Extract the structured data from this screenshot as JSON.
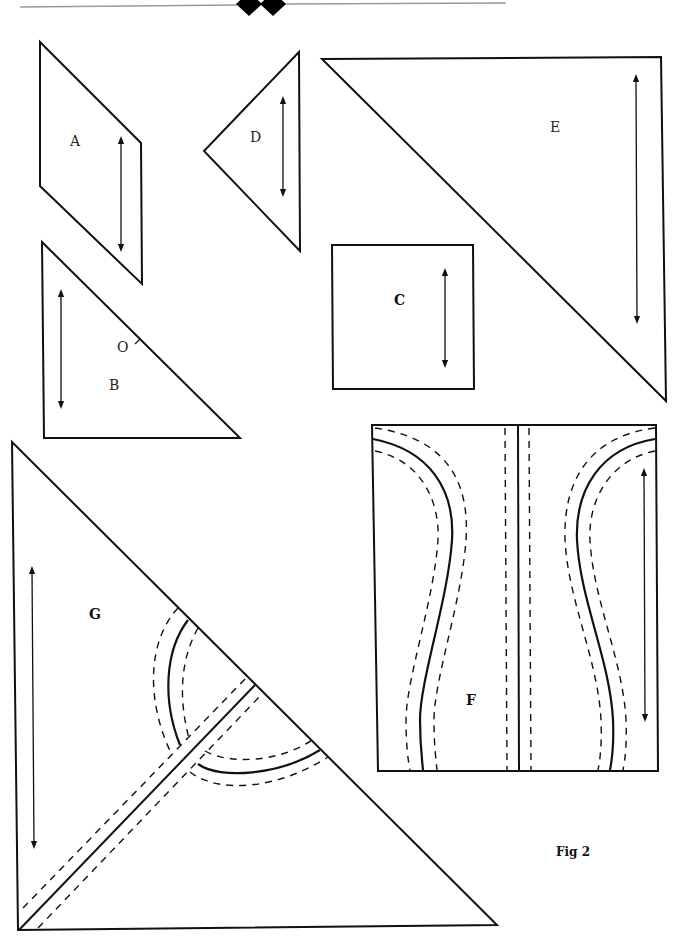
{
  "header": {
    "ornament": "double-diamond-divider"
  },
  "pieces": [
    {
      "id": "A",
      "label": "A",
      "shape": "parallelogram",
      "grainline": true
    },
    {
      "id": "B",
      "label": "B",
      "shape": "right-triangle",
      "grainline": true,
      "marker": "O"
    },
    {
      "id": "C",
      "label": "C",
      "shape": "square",
      "grainline": true
    },
    {
      "id": "D",
      "label": "D",
      "shape": "triangle",
      "grainline": true
    },
    {
      "id": "E",
      "label": "E",
      "shape": "right-triangle",
      "grainline": true
    },
    {
      "id": "F",
      "label": "F",
      "shape": "rectangle-with-curved-seams",
      "grainline": true
    },
    {
      "id": "G",
      "label": "G",
      "shape": "right-triangle-with-curved-seams",
      "grainline": true
    }
  ],
  "labels": {
    "A": "A",
    "B": "B",
    "B_marker": "O",
    "C": "C",
    "D": "D",
    "E": "E",
    "F": "F",
    "G": "G"
  },
  "caption": "Fig 2"
}
